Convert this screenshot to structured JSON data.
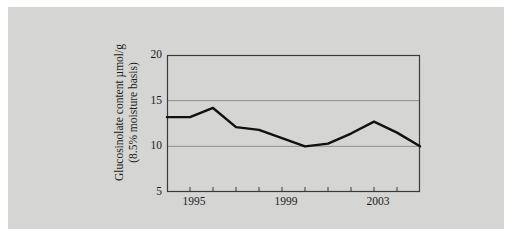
{
  "chart_data": {
    "type": "line",
    "title": "",
    "xlabel": "",
    "ylabel": "Glucosinolate content µmol/g (8.5% moisture basis)",
    "ylabel_line1": "Glucosinolate content µmol/g",
    "ylabel_line2": "(8.5% moisture basis)",
    "x": [
      1993,
      1994,
      1995,
      1996,
      1997,
      1998,
      1999,
      2000,
      2001,
      2002,
      2003,
      2004
    ],
    "values": [
      13.2,
      13.2,
      14.2,
      12.1,
      11.8,
      10.9,
      10.0,
      10.3,
      11.4,
      12.7,
      11.5,
      10.0
    ],
    "xlim": [
      1993,
      2004
    ],
    "ylim": [
      5,
      20
    ],
    "yticks": [
      5,
      10,
      15,
      20
    ],
    "ytick_labels": [
      "5",
      "10",
      "15",
      "20"
    ],
    "xticks": [
      1993,
      1994,
      1995,
      1996,
      1997,
      1998,
      1999,
      2000,
      2001,
      2002,
      2003,
      2004
    ],
    "xtick_labels_shown": [
      "1995",
      "1999",
      "2003"
    ],
    "xtick_label_positions": [
      1995,
      1999,
      2003
    ],
    "grid": "horizontal",
    "gridlines_at": [
      10,
      15
    ],
    "legend": "none",
    "series_color": "#111111",
    "line_width": 2.4,
    "plot_background": "#d5d5d3",
    "panel_background": "#d5d5d3",
    "axis_color": "#3a3a3a",
    "grid_color": "#8d8d8d",
    "text_color": "#1b1b1b"
  }
}
